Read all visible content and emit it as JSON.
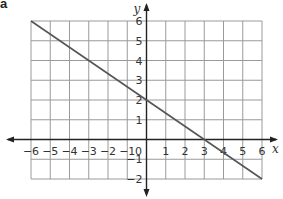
{
  "part_label": "a",
  "chart_data": {
    "type": "line",
    "title": "",
    "xlabel": "x",
    "ylabel": "y",
    "xlim": [
      -6,
      6
    ],
    "ylim": [
      -2,
      6
    ],
    "grid": true,
    "x_ticks": [
      -6,
      -5,
      -4,
      -3,
      -2,
      -1,
      0,
      1,
      2,
      3,
      4,
      5,
      6
    ],
    "y_ticks": [
      -2,
      -1,
      1,
      2,
      3,
      4,
      5,
      6
    ],
    "origin_label": "0",
    "series": [
      {
        "name": "line",
        "equation": "y = -2/3 x + 2",
        "x": [
          -6,
          -3,
          0,
          3,
          6
        ],
        "y": [
          6,
          4,
          2,
          0,
          -2
        ]
      }
    ],
    "colors": {
      "grid": "#9a9a9a",
      "axis": "#222222",
      "line": "#555555"
    }
  }
}
